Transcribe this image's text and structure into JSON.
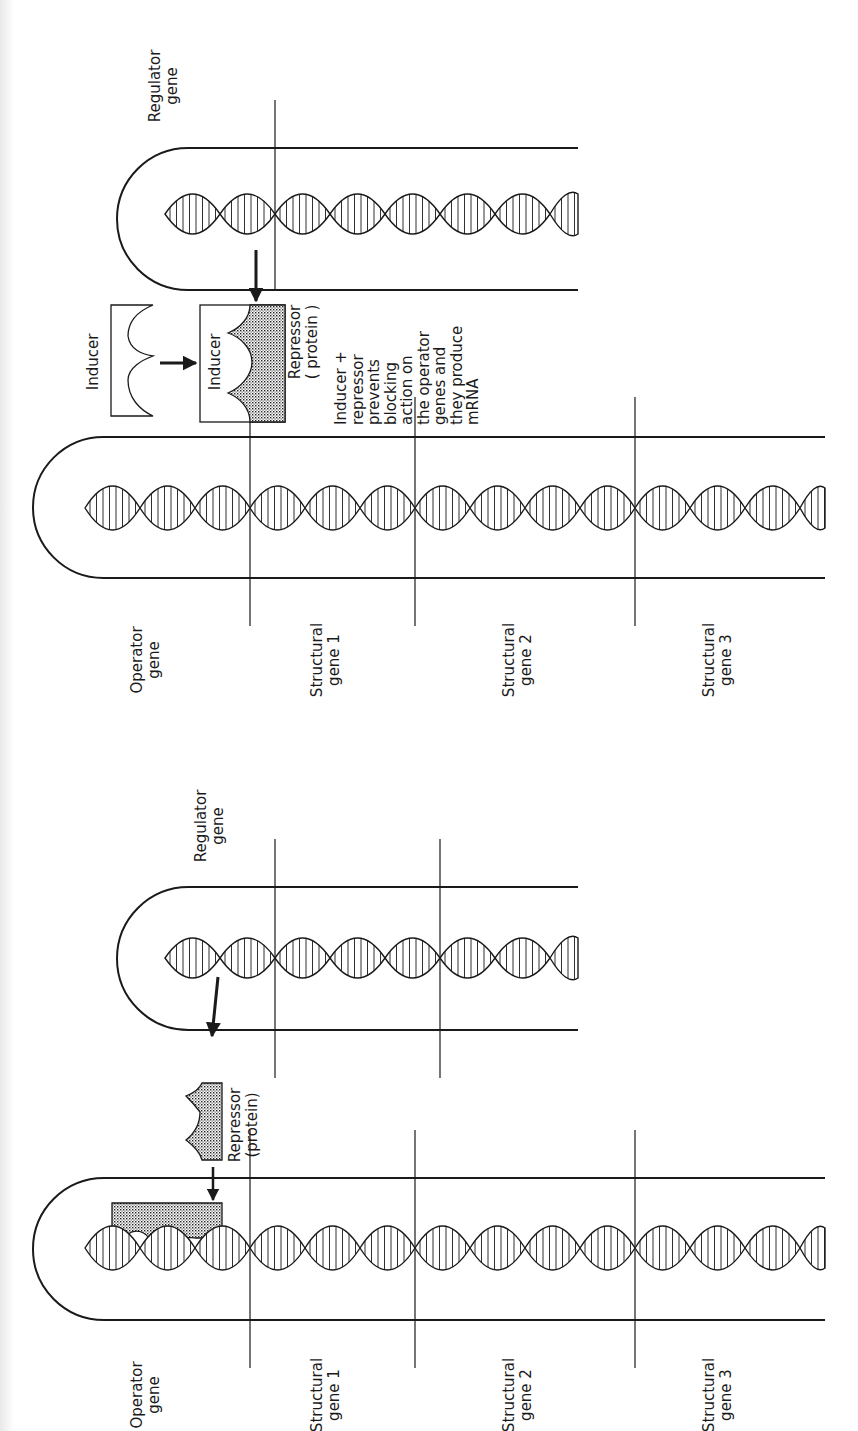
{
  "figure": {
    "colors": {
      "ink": "#1a1a1a",
      "paper": "#ffffff",
      "shade": "#bdbdbd"
    },
    "top_panel": {
      "name": "induction",
      "regulator": {
        "label_line1": "Regulator",
        "label_line2": "gene",
        "tube": {
          "top": 148,
          "bottom": 290,
          "left": 117,
          "right": 578
        },
        "dividers": [
          275
        ],
        "helix": {
          "y": 214,
          "x_start": 165,
          "x_end": 578,
          "turn": 55,
          "amp": 20
        }
      },
      "operon": {
        "tube": {
          "top": 437,
          "bottom": 578,
          "left": 33,
          "right": 825
        },
        "dividers": [
          250,
          415,
          635
        ],
        "helix": {
          "y": 508,
          "x_start": 85,
          "x_end": 825,
          "turn": 55,
          "amp": 22
        },
        "labels": [
          {
            "line1": "Operator",
            "line2": "gene",
            "x": 150
          },
          {
            "line1": "Structural",
            "line2": "gene 1",
            "x": 330
          },
          {
            "line1": "Structural",
            "line2": "gene 2",
            "x": 522
          },
          {
            "line1": "Structural",
            "line2": "gene 3",
            "x": 722
          }
        ]
      },
      "inducer_free_label": "Inducer",
      "inducer_bound_label": "Inducer",
      "repressor_label_line1": "Repressor",
      "repressor_label_line2": "( protein )",
      "note_lines": [
        "Inducer +",
        "repressor",
        "prevents",
        "blocking",
        "action on",
        "the operator",
        "genes and",
        "they produce",
        "mRNA"
      ]
    },
    "bottom_panel": {
      "name": "repression",
      "regulator": {
        "label_line1": "Regulator",
        "label_line2": "gene",
        "tube": {
          "top": 887,
          "bottom": 1030,
          "left": 117,
          "right": 578
        },
        "dividers": [
          275,
          440
        ],
        "helix": {
          "y": 958,
          "x_start": 165,
          "x_end": 578,
          "turn": 55,
          "amp": 20
        }
      },
      "operon": {
        "tube": {
          "top": 1178,
          "bottom": 1320,
          "left": 33,
          "right": 825
        },
        "dividers": [
          250,
          415,
          635
        ],
        "helix": {
          "y": 1248,
          "x_start": 85,
          "x_end": 825,
          "turn": 55,
          "amp": 22
        },
        "labels": [
          {
            "line1": "Operator",
            "line2": "gene",
            "x": 150
          },
          {
            "line1": "Structural",
            "line2": "gene 1",
            "x": 330
          },
          {
            "line1": "Structural",
            "line2": "gene 2",
            "x": 522
          },
          {
            "line1": "Structural",
            "line2": "gene 3",
            "x": 722
          }
        ]
      },
      "repressor_label_line1": "Repressor",
      "repressor_label_line2": "(protein)"
    }
  }
}
